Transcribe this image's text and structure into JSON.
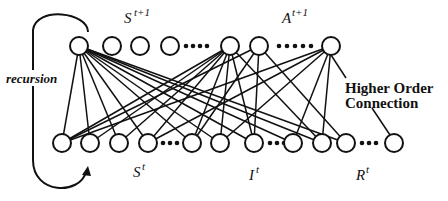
{
  "diagram": {
    "labels": {
      "top_state": {
        "base": "S",
        "sup": "t+1"
      },
      "top_action": {
        "base": "A",
        "sup": "t+1"
      },
      "bottom_state": {
        "base": "S",
        "sup": "t"
      },
      "bottom_input": {
        "base": "I",
        "sup": "t"
      },
      "bottom_reward": {
        "base": "R",
        "sup": "t"
      },
      "recursion": "recursion",
      "higher_order_line1": "Higher Order",
      "higher_order_line2": "Connection"
    },
    "colors": {
      "stroke": "#111111",
      "background": "#ffffff"
    },
    "node_radius": 9,
    "top_nodes": [
      {
        "id": "T1",
        "x": 79,
        "y": 46
      },
      {
        "id": "T2",
        "x": 112,
        "y": 46
      },
      {
        "id": "T3",
        "x": 140,
        "y": 46
      },
      {
        "id": "T4",
        "x": 170,
        "y": 46
      },
      {
        "id": "T5",
        "x": 230,
        "y": 46
      },
      {
        "id": "T6",
        "x": 259,
        "y": 46
      },
      {
        "id": "T7",
        "x": 331,
        "y": 46
      }
    ],
    "bottom_nodes": [
      {
        "id": "B1",
        "x": 62,
        "y": 143
      },
      {
        "id": "B2",
        "x": 90,
        "y": 143
      },
      {
        "id": "B3",
        "x": 119,
        "y": 143
      },
      {
        "id": "B4",
        "x": 148,
        "y": 143
      },
      {
        "id": "B5",
        "x": 192,
        "y": 143
      },
      {
        "id": "B6",
        "x": 220,
        "y": 143
      },
      {
        "id": "B7",
        "x": 254,
        "y": 143
      },
      {
        "id": "B8",
        "x": 293,
        "y": 143
      },
      {
        "id": "B9",
        "x": 322,
        "y": 143
      },
      {
        "id": "B10",
        "x": 346,
        "y": 143
      },
      {
        "id": "B11",
        "x": 394,
        "y": 143
      }
    ],
    "ellipses": [
      {
        "x": [
          186,
          193,
          200,
          207
        ],
        "y": 46
      },
      {
        "x": [
          279,
          287,
          295,
          303,
          311
        ],
        "y": 46
      },
      {
        "x": [
          163,
          170,
          177
        ],
        "y": 143
      },
      {
        "x": [
          270,
          277,
          284
        ],
        "y": 143
      },
      {
        "x": [
          362,
          369,
          376
        ],
        "y": 143
      }
    ],
    "edges": [
      [
        "T1",
        "B1"
      ],
      [
        "T1",
        "B2"
      ],
      [
        "T1",
        "B3"
      ],
      [
        "T1",
        "B4"
      ],
      [
        "T1",
        "B5"
      ],
      [
        "T1",
        "B6"
      ],
      [
        "T1",
        "B7"
      ],
      [
        "T1",
        "B8"
      ],
      [
        "T1",
        "B9"
      ],
      [
        "T1",
        "B10"
      ],
      [
        "T5",
        "B1"
      ],
      [
        "T5",
        "B2"
      ],
      [
        "T5",
        "B3"
      ],
      [
        "T5",
        "B4"
      ],
      [
        "T5",
        "B5"
      ],
      [
        "T5",
        "B6"
      ],
      [
        "T5",
        "B7"
      ],
      [
        "T5",
        "B9"
      ],
      [
        "T6",
        "B1"
      ],
      [
        "T6",
        "B5"
      ],
      [
        "T6",
        "B7"
      ],
      [
        "T6",
        "B10"
      ],
      [
        "T7",
        "B1"
      ],
      [
        "T7",
        "B4"
      ],
      [
        "T7",
        "B6"
      ],
      [
        "T7",
        "B8"
      ],
      [
        "T7",
        "B9"
      ]
    ],
    "higher_order_edges": [
      {
        "from": [
          331,
          55
        ],
        "to": [
          346,
          78
        ]
      },
      {
        "from": [
          372,
          108
        ],
        "to": [
          390,
          135
        ]
      }
    ]
  }
}
